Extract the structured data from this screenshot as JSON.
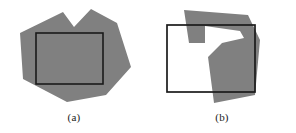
{
  "figure": {
    "background_color": "#ffffff",
    "shape_fill_color": "#808080",
    "outline_color": "#1a1a1a",
    "panels": [
      {
        "id": "a",
        "caption": "(a)",
        "description": "Concave gray polygon containing a rectangle entirely inside it",
        "polygon_points": "20,33 63,12 74,27 91,9 117,23 131,67 106,95 67,102 23,79",
        "rectangle": {
          "x": 36,
          "y": 33,
          "width": 67,
          "height": 51
        }
      },
      {
        "id": "b",
        "caption": "(b)",
        "description": "Concave gray polygon overlapping a rectangle which is not contained",
        "polygon_points": "36,10 100,15 96,22 57,21 57,43 41,43 40,18 36,10 100,15 112,40 100,47 90,44 72,63 74,97 107,95 102,100 66,103 60,57 74,43 96,38 100,47 112,40 107,95",
        "polygon_points_clean": "36,10 100,15 112,40 107,95 66,103 60,57 74,43 96,38 92,31 57,26 57,43 41,43",
        "rectangle": {
          "x": 19,
          "y": 25,
          "width": 88,
          "height": 67
        }
      }
    ]
  }
}
